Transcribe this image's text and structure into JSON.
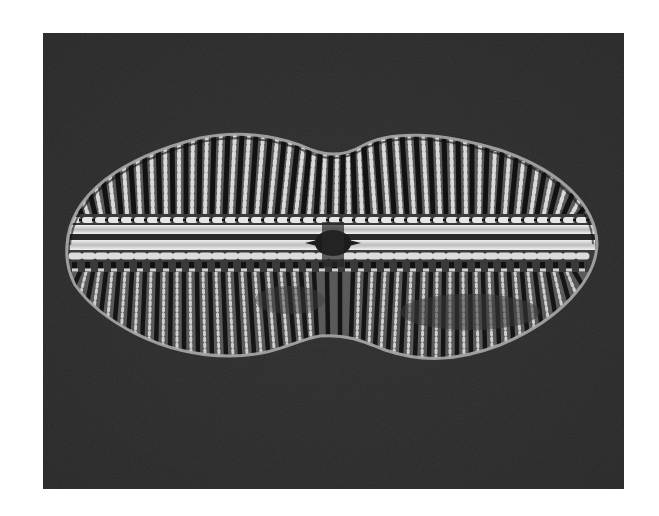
{
  "image": {
    "subject": "diatom valve micrograph",
    "background_color": "#2b2b2b",
    "page_color": "#ffffff",
    "frame": {
      "x": 43,
      "y": 33,
      "width": 581,
      "height": 456
    },
    "valve": {
      "center": [
        333,
        244
      ],
      "left_apex": [
        67,
        245
      ],
      "right_apex": [
        597,
        244
      ],
      "top_lobes_y": 133,
      "top_waist": [
        335,
        153
      ],
      "bottom_lobes_y": 358,
      "bottom_waist": [
        320,
        337
      ],
      "outline_color": "#9a9a9a",
      "rib_dark": "#111111",
      "rib_light": "#d8d8d8"
    },
    "central_nodule": {
      "x": 333,
      "y": 243
    },
    "raphe_y": 237
  }
}
